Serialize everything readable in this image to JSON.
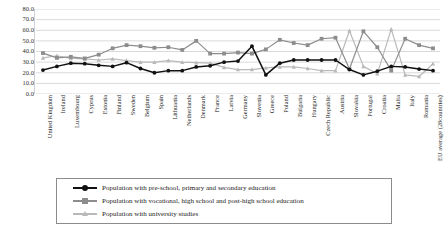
{
  "chart_data": {
    "type": "line",
    "title": "",
    "subtitle": "",
    "xlabel": "",
    "ylabel": "",
    "ylim": [
      0,
      80
    ],
    "ytick_step": 10,
    "ytick_labels": [
      "0.0",
      "10.0",
      "20.0",
      "30.0",
      "40.0",
      "50.0",
      "60.0",
      "70.0",
      "80.0"
    ],
    "grid": true,
    "grid_axis": "y",
    "legend_position": "bottom",
    "categories": [
      "United Kingdom",
      "Ireland",
      "Luxembourg",
      "Cyprus",
      "Estonia",
      "Finland",
      "Sweden",
      "Belgium",
      "Spain",
      "Lithuania",
      "Netherlands",
      "Denmark",
      "France",
      "Latvia",
      "Germany",
      "Slovenia",
      "Greece",
      "Poland",
      "Bulgaria",
      "Hungary",
      "Czech Republic",
      "Austria",
      "Slovakia",
      "Portugal",
      "Croatia",
      "Malta",
      "Italy",
      "Romania",
      "EU average (28countries)"
    ],
    "series": [
      {
        "name": "Population with pre-school, primary and secondary education",
        "color": "#111111",
        "marker": "circle",
        "values": [
          22.5,
          26.0,
          29.0,
          28.5,
          27.0,
          26.0,
          29.5,
          24.0,
          20.0,
          22.0,
          22.0,
          25.5,
          26.5,
          30.0,
          31.0,
          45.0,
          18.0,
          29.0,
          32.0,
          32.0,
          32.0,
          32.0,
          23.0,
          18.0,
          21.5,
          26.0,
          25.5,
          23.5,
          22.0
        ]
      },
      {
        "name": "Population with vocational, high school and post-high school education",
        "color": "#8d8d8d",
        "marker": "square",
        "values": [
          38.5,
          34.0,
          35.0,
          33.5,
          37.0,
          43.0,
          46.0,
          45.0,
          43.5,
          44.0,
          41.5,
          50.0,
          38.0,
          38.0,
          39.0,
          38.0,
          42.0,
          51.0,
          48.0,
          46.0,
          52.0,
          53.0,
          23.5,
          59.0,
          44.0,
          22.0,
          52.0,
          46.0,
          43.0
        ]
      },
      {
        "name": "Population with university studies",
        "color": "#b9b9b9",
        "marker": "triangle",
        "values": [
          34.0,
          36.0,
          33.5,
          33.0,
          32.0,
          33.0,
          31.5,
          30.0,
          30.0,
          31.5,
          30.0,
          29.5,
          29.0,
          25.0,
          23.0,
          23.0,
          24.5,
          25.5,
          25.5,
          24.0,
          22.0,
          22.0,
          59.5,
          26.0,
          19.0,
          61.0,
          18.0,
          16.5,
          28.5
        ]
      }
    ]
  },
  "legend": {
    "items": [
      {
        "label": "Population with pre-school, primary and secondary education"
      },
      {
        "label": "Population with vocational, high school and post-high school education"
      },
      {
        "label": "Population with university studies"
      }
    ]
  }
}
